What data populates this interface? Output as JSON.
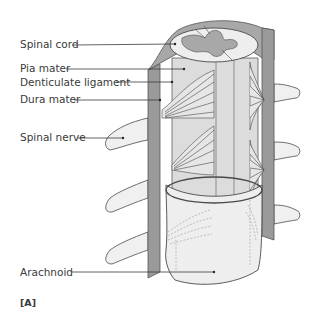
{
  "figure": {
    "panel_label": "[A]",
    "labels": [
      {
        "id": "spinal-cord",
        "text": "Spinal cord",
        "x": 20,
        "y": 48,
        "line_to": [
          175,
          44
        ]
      },
      {
        "id": "pia-mater",
        "text": "Pia mater",
        "x": 20,
        "y": 72,
        "line_to": [
          184,
          69
        ]
      },
      {
        "id": "denticulate-ligament",
        "text": "Denticulate ligament",
        "x": 20,
        "y": 87,
        "line_to": [
          172,
          82
        ]
      },
      {
        "id": "dura-mater",
        "text": "Dura mater",
        "x": 20,
        "y": 103,
        "line_to": [
          160,
          100
        ]
      },
      {
        "id": "spinal-nerve",
        "text": "Spinal nerve",
        "x": 20,
        "y": 140,
        "line_to": [
          123,
          139
        ]
      },
      {
        "id": "arachnoid",
        "text": "Arachnoid",
        "x": 20,
        "y": 275,
        "line_to": [
          214,
          272
        ]
      }
    ]
  },
  "colors": {
    "dura": "#9a9a9a",
    "dura_edge": "#555555",
    "pia": "#dcdcdc",
    "cord_white": "#eeeeee",
    "gray_matter": "#a8a8a8",
    "nerve": "#f0f0f0",
    "outline": "#4a4a4a",
    "text": "#3a3a3a"
  }
}
